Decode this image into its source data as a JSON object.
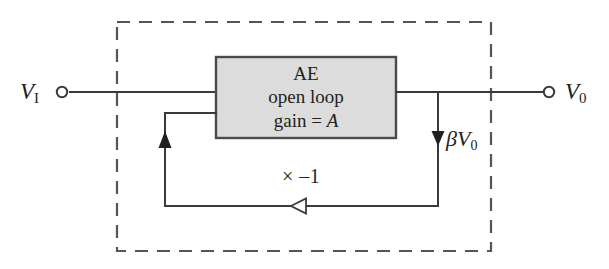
{
  "figure": {
    "type": "feedback-amplifier-block-diagram",
    "background_color": "#ffffff",
    "line_color": "#3a3a3a",
    "text_color": "#231f20",
    "box_fill_color": "#dcdcdc",
    "box_stroke_color": "#4a4a4a",
    "dashed_border_color": "#555555"
  },
  "terminals": {
    "input": {
      "label": "V",
      "subscript": "I"
    },
    "output": {
      "label": "V",
      "subscript": "0"
    }
  },
  "amplifier_block": {
    "line1": "AE",
    "line2": "open loop",
    "line3_prefix": "gain = ",
    "line3_italic": "A"
  },
  "feedback": {
    "tap_label": "βV",
    "tap_label_subscript": "0",
    "path_label": "× –1"
  },
  "icons": {
    "input_terminal": "open-circle-terminal",
    "output_terminal": "open-circle-terminal",
    "feedback_tap_arrow": "arrow-down-filled",
    "feedback_return_arrow": "arrow-left-hollow",
    "feedback_input_arrow": "arrow-up-filled"
  }
}
